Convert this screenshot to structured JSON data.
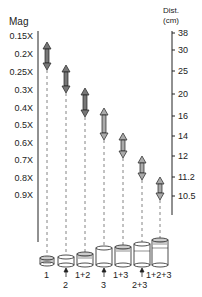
{
  "left_axis": {
    "title": "Mag",
    "ticks": [
      "0.15X",
      "0.2X",
      "0.25X",
      "0.3X",
      "0.4X",
      "0.5X",
      "0.6X",
      "0.7X",
      "0.8X",
      "0.9X"
    ]
  },
  "right_axis": {
    "title_line1": "Dist.",
    "title_line2": "(cm)",
    "ticks": [
      "38",
      "30",
      "25",
      "20",
      "16",
      "14",
      "12",
      "11.2",
      "10.5"
    ]
  },
  "rings": [
    {
      "label": "1"
    },
    {
      "label": "2"
    },
    {
      "label": "1+2"
    },
    {
      "label": "3"
    },
    {
      "label": "1+3"
    },
    {
      "label": "2+3"
    },
    {
      "label": "1+2+3"
    }
  ],
  "colors": {
    "line": "#222222",
    "arrow_fill": "#888888",
    "dash": "#666666"
  }
}
